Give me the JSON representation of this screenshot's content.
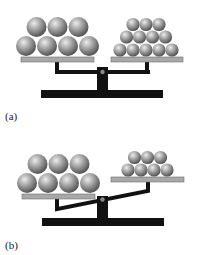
{
  "panels": [
    {
      "id": "a",
      "label": "(a)",
      "state": "balanced",
      "left_pan": {
        "ball_count": 7,
        "ball_size": "large",
        "rows": [
          3,
          4
        ]
      },
      "right_pan": {
        "ball_count": 12,
        "ball_size": "small",
        "rows": [
          3,
          4,
          5
        ]
      }
    },
    {
      "id": "b",
      "label": "(b)",
      "state": "tilted-left-down",
      "left_pan": {
        "ball_count": 7,
        "ball_size": "large",
        "rows": [
          3,
          4
        ]
      },
      "right_pan": {
        "ball_count": 7,
        "ball_size": "small",
        "rows": [
          3,
          4
        ]
      }
    }
  ],
  "colors": {
    "frame": "#111111",
    "pan": "#a8a8a8",
    "pan_edge": "#6e6e6e",
    "ball_light": "#e6e6e6",
    "ball_mid": "#9a9a9a",
    "ball_dark": "#4f4f4f",
    "pivot": "#8a8a8a"
  }
}
